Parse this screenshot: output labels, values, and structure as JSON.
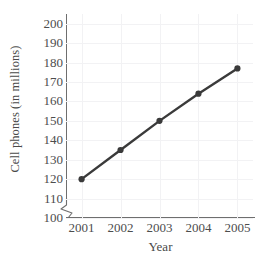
{
  "chart_data": {
    "type": "line",
    "title": "",
    "xlabel": "Year",
    "ylabel": "Cell phones (in millions)",
    "categories": [
      "2001",
      "2002",
      "2003",
      "2004",
      "2005"
    ],
    "x": [
      2001,
      2002,
      2003,
      2004,
      2005
    ],
    "values": [
      120,
      135,
      150,
      164,
      177
    ],
    "series": [
      {
        "name": "Cell phones",
        "values": [
          120,
          135,
          150,
          164,
          177
        ]
      }
    ],
    "xlim": [
      2000.6,
      2005.4
    ],
    "ylim": [
      100,
      205
    ],
    "ytick_labels": [
      "200",
      "190",
      "180",
      "170",
      "160",
      "150",
      "140",
      "130",
      "120",
      "110",
      "100"
    ],
    "ytick_values": [
      200,
      190,
      180,
      170,
      160,
      150,
      140,
      130,
      120,
      110,
      100
    ],
    "xtick_labels": [
      "2001",
      "2002",
      "2003",
      "2004",
      "2005"
    ],
    "grid": true,
    "legend": "none",
    "axis_break": "y-axis broken below 100",
    "line_color": "#3a3a3a",
    "marker_color": "#3a3a3a",
    "marker": "circle",
    "grid_color": "#f2f2f4",
    "axis_color": "#6e6e6e",
    "text_color": "#4d4d4d",
    "background": "#ffffff"
  }
}
